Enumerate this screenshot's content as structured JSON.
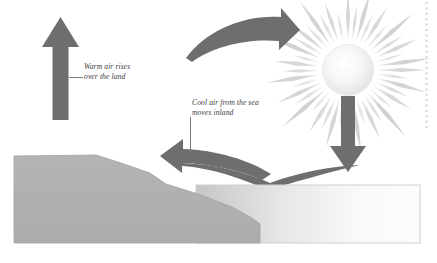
{
  "diagram": {
    "background_color": "#ffffff"
  },
  "labels": {
    "warm": {
      "line1": "Warm air rises",
      "line2": "over the land",
      "name": "warm-air-label",
      "color": "#3d3d3d"
    },
    "cool": {
      "line1": "Cool air from the sea",
      "line2": "moves inland",
      "name": "cool-air-label",
      "color": "#3d3d3d"
    }
  },
  "elements": {
    "up_arrow": {
      "icon": "arrow-up-icon",
      "color": "#6e6e6e",
      "direction": "up"
    },
    "down_arrow": {
      "icon": "arrow-down-icon",
      "color": "#6e6e6e",
      "direction": "down"
    },
    "top_curved_arrow": {
      "icon": "curved-arrow-right-icon",
      "color": "#6e6e6e",
      "direction": "right"
    },
    "bottom_curved_arrow": {
      "icon": "curved-arrow-left-icon",
      "color": "#6e6e6e",
      "direction": "left"
    },
    "sun": {
      "icon": "sun-icon",
      "ray_color": "#d8d8d8",
      "core_color": "#f2f2f2",
      "rays": 44
    },
    "land": {
      "icon": "landmass-shape",
      "color": "#b0b0b0",
      "outline": "#9a9a9a"
    },
    "sea": {
      "icon": "sea-shape",
      "color_left": "#c8c8c8",
      "color_right": "#fbfbfb",
      "outline": "#c9c9c9"
    },
    "leader_warm": {
      "icon": "leader-line-horizontal",
      "color": "#7a7a7a"
    },
    "leader_cool": {
      "icon": "leader-line-vertical",
      "color": "#7a7a7a"
    },
    "edge_marks": {
      "icon": "dotted-edge-line",
      "color": "#d5d5d5"
    }
  }
}
